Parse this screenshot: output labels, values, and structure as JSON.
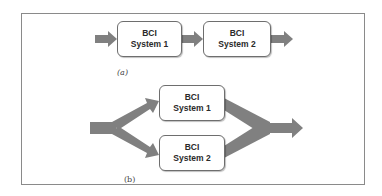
{
  "diagram": {
    "type": "BCI system combination diagram",
    "colors": {
      "arrow": "#808080",
      "box_border": "#6e6e6e",
      "frame": "#8a8a8a",
      "text": "#2a2a2a"
    },
    "panel_a": {
      "label": "(a)",
      "layout": "serial",
      "boxes": [
        {
          "line1": "BCI",
          "line2": "System 1"
        },
        {
          "line1": "BCI",
          "line2": "System 2"
        }
      ]
    },
    "panel_b": {
      "label": "(b)",
      "layout": "parallel",
      "boxes": [
        {
          "line1": "BCI",
          "line2": "System 1"
        },
        {
          "line1": "BCI",
          "line2": "System 2"
        }
      ]
    }
  }
}
